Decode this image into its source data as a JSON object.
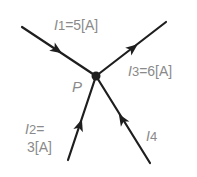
{
  "diagram": {
    "type": "kirchhoff-current-junction",
    "node": {
      "label": "P",
      "x": 96,
      "y": 76
    },
    "branches": [
      {
        "id": "I1",
        "name": "I",
        "sub": "1",
        "value_text": "=5[A]",
        "direction": "into-node",
        "from": [
          22,
          27
        ],
        "to": [
          96,
          76
        ]
      },
      {
        "id": "I3",
        "name": "I",
        "sub": "3",
        "value_text": "=6[A]",
        "direction": "out-of-node",
        "from": [
          96,
          76
        ],
        "to": [
          166,
          22
        ]
      },
      {
        "id": "I2",
        "name": "I",
        "sub": "2",
        "value_text_line1": "=",
        "value_text_line2": "3[A]",
        "direction": "into-node",
        "from": [
          68,
          160
        ],
        "to": [
          96,
          76
        ]
      },
      {
        "id": "I4",
        "name": "I",
        "sub": "4",
        "value_text": "",
        "direction": "into-node",
        "from": [
          150,
          163
        ],
        "to": [
          96,
          76
        ]
      }
    ],
    "colors": {
      "line": "#1e1e1e",
      "text": "#8a8a8a"
    }
  }
}
